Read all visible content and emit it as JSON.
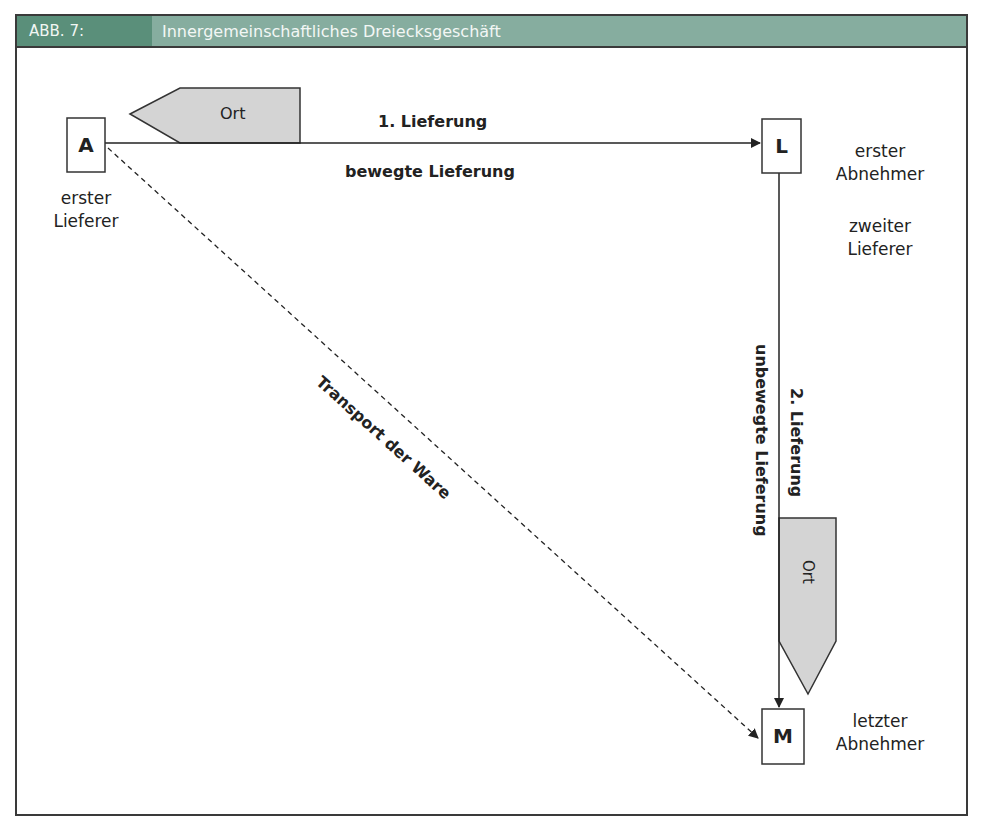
{
  "header": {
    "label": "ABB. 7:",
    "title": "Innergemeinschaftliches Dreiecksgeschäft",
    "label_bg": "#5a8f7a",
    "title_bg": "#86ad9f"
  },
  "nodes": [
    {
      "id": "A",
      "letter": "A",
      "caption_line1": "erster",
      "caption_line2": "Lieferer"
    },
    {
      "id": "L",
      "letter": "L",
      "caption_line1": "erster",
      "caption_line2": "Abnehmer",
      "caption2_line1": "zweiter",
      "caption2_line2": "Lieferer"
    },
    {
      "id": "M",
      "letter": "M",
      "caption_line1": "letzter",
      "caption_line2": "Abnehmer"
    }
  ],
  "edges": {
    "first_delivery": {
      "label": "1. Lieferung",
      "sublabel": "bewegte Lieferung"
    },
    "second_delivery": {
      "label": "2. Lieferung",
      "sublabel": "unbewegte Lieferung"
    },
    "transport": {
      "label": "Transport der Ware"
    }
  },
  "place_markers": [
    {
      "label": "Ort",
      "attached_to": "first_delivery",
      "fill": "#d4d4d4"
    },
    {
      "label": "Ort",
      "attached_to": "second_delivery",
      "fill": "#d4d4d4"
    }
  ]
}
